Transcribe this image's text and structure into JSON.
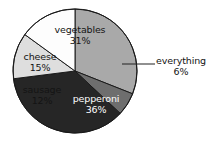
{
  "chart_data": {
    "type": "pie",
    "title": "",
    "subtitle": "",
    "xlabel": "",
    "ylabel": "",
    "legend_position": "none",
    "grid": false,
    "units": "percent",
    "total": 100,
    "categories": [
      "vegetables",
      "everything",
      "pepperoni",
      "sausage",
      "cheese"
    ],
    "values": [
      31,
      6,
      36,
      12,
      15
    ],
    "slices": [
      {
        "label": "vegetables",
        "value": 31,
        "value_text": "31%",
        "color": "#a9a9a9",
        "text_color": "#141414",
        "label_placement": "inside",
        "start_angle_deg": 0,
        "end_angle_deg": 111.6
      },
      {
        "label": "everything",
        "value": 6,
        "value_text": "6%",
        "color": "#6e6e6e",
        "text_color": "#141414",
        "label_placement": "outside-leader",
        "start_angle_deg": 111.6,
        "end_angle_deg": 133.2
      },
      {
        "label": "pepperoni",
        "value": 36,
        "value_text": "36%",
        "color": "#262626",
        "text_color": "#ffffff",
        "label_placement": "inside",
        "start_angle_deg": 133.2,
        "end_angle_deg": 262.8
      },
      {
        "label": "sausage",
        "value": 12,
        "value_text": "12%",
        "color": "#dedede",
        "text_color": "#141414",
        "label_placement": "inside",
        "start_angle_deg": 262.8,
        "end_angle_deg": 306.0
      },
      {
        "label": "cheese",
        "value": 15,
        "value_text": "15%",
        "color": "#fdfdfd",
        "text_color": "#141414",
        "label_placement": "inside",
        "start_angle_deg": 306.0,
        "end_angle_deg": 360.0
      }
    ],
    "geometry": {
      "center_x": 75,
      "center_y": 71,
      "radius": 62,
      "start_at_twelve_oclock": true,
      "direction": "clockwise"
    },
    "leader_line": {
      "for": "everything",
      "from_x": 122,
      "from_y": 64,
      "to_x": 155,
      "to_y": 64,
      "color": "#222222"
    },
    "stroke": {
      "color": "#1a1a1a",
      "width": 1
    },
    "background": "#ffffff"
  }
}
